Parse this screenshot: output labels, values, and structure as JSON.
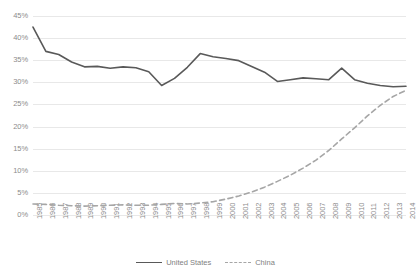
{
  "chart_data": {
    "type": "line",
    "title": "",
    "xlabel": "",
    "ylabel": "",
    "ylim": [
      0,
      45
    ],
    "ytick_step": 5,
    "grid": true,
    "legend_position": "bottom-center",
    "yticks": [
      "45%",
      "40%",
      "35%",
      "30%",
      "25%",
      "20%",
      "15%",
      "10%",
      "5%",
      "0%"
    ],
    "categories": [
      "1985",
      "1986",
      "1987",
      "1988",
      "1989",
      "1990",
      "1991",
      "1992",
      "1993",
      "1994",
      "1995",
      "1996",
      "1997",
      "1998",
      "1999",
      "2000",
      "2001",
      "2002",
      "2003",
      "2004",
      "2005",
      "2006",
      "2007",
      "2008",
      "2009",
      "2010",
      "2011",
      "2012",
      "2013",
      "2014"
    ],
    "series": [
      {
        "name": "United States",
        "style": "solid",
        "color": "#595959",
        "values": [
          42.5,
          37.0,
          36.3,
          34.6,
          33.5,
          33.6,
          33.2,
          33.5,
          33.3,
          32.4,
          29.3,
          30.9,
          33.4,
          36.5,
          35.8,
          35.4,
          34.9,
          33.6,
          32.3,
          30.2,
          30.6,
          31.0,
          30.8,
          30.6,
          33.2,
          30.6,
          29.8,
          29.3,
          29.0,
          29.1
        ]
      },
      {
        "name": "China",
        "style": "dashed",
        "color": "#a6a6a6",
        "values": [
          2.5,
          2.4,
          2.2,
          2.1,
          2.0,
          2.1,
          2.2,
          2.3,
          2.2,
          2.2,
          2.4,
          2.6,
          2.5,
          2.7,
          3.0,
          3.6,
          4.3,
          5.2,
          6.3,
          7.6,
          9.0,
          10.6,
          12.4,
          14.6,
          17.2,
          19.7,
          22.4,
          24.8,
          26.8,
          28.2
        ]
      }
    ]
  },
  "legend": {
    "entries": [
      {
        "label": "United States"
      },
      {
        "label": "China"
      }
    ]
  }
}
